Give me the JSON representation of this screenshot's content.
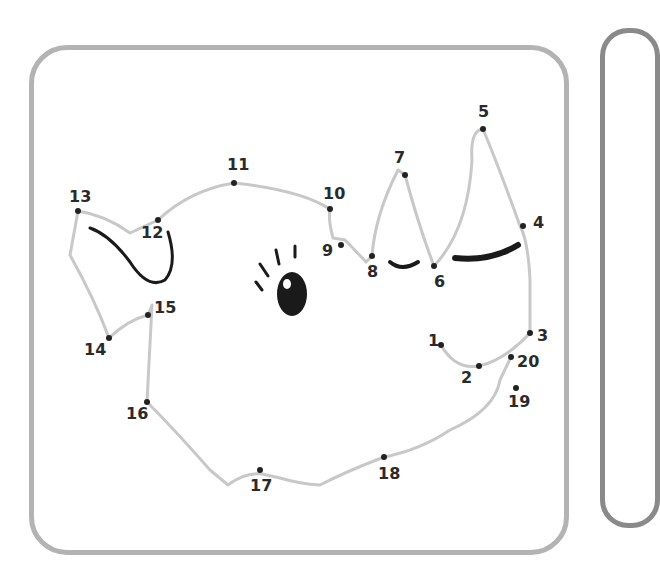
{
  "worksheet": {
    "type": "connect-the-dots",
    "subject": "pig face (drawn by following numbered dots)",
    "colors": {
      "frame": "#b3b3b3",
      "side_frame": "#8a8a8a",
      "traced_line": "#c8c8c8",
      "ink": "#1a1a1a"
    },
    "dots": [
      {
        "n": "1",
        "x": 441,
        "y": 345,
        "lx": 428,
        "ly": 333
      },
      {
        "n": "2",
        "x": 479,
        "y": 366,
        "lx": 461,
        "ly": 370
      },
      {
        "n": "3",
        "x": 530,
        "y": 333,
        "lx": 537,
        "ly": 328
      },
      {
        "n": "4",
        "x": 523,
        "y": 226,
        "lx": 533,
        "ly": 215
      },
      {
        "n": "5",
        "x": 483,
        "y": 129,
        "lx": 478,
        "ly": 104
      },
      {
        "n": "6",
        "x": 434,
        "y": 266,
        "lx": 434,
        "ly": 274
      },
      {
        "n": "7",
        "x": 405,
        "y": 175,
        "lx": 394,
        "ly": 150
      },
      {
        "n": "8",
        "x": 372,
        "y": 256,
        "lx": 367,
        "ly": 264
      },
      {
        "n": "9",
        "x": 341,
        "y": 245,
        "lx": 322,
        "ly": 243
      },
      {
        "n": "10",
        "x": 330,
        "y": 209,
        "lx": 323,
        "ly": 186
      },
      {
        "n": "11",
        "x": 234,
        "y": 183,
        "lx": 227,
        "ly": 157
      },
      {
        "n": "12",
        "x": 158,
        "y": 220,
        "lx": 141,
        "ly": 225
      },
      {
        "n": "13",
        "x": 78,
        "y": 211,
        "lx": 69,
        "ly": 189
      },
      {
        "n": "14",
        "x": 109,
        "y": 338,
        "lx": 84,
        "ly": 342
      },
      {
        "n": "15",
        "x": 148,
        "y": 315,
        "lx": 154,
        "ly": 300
      },
      {
        "n": "16",
        "x": 147,
        "y": 402,
        "lx": 126,
        "ly": 406
      },
      {
        "n": "17",
        "x": 260,
        "y": 470,
        "lx": 250,
        "ly": 478
      },
      {
        "n": "18",
        "x": 384,
        "y": 457,
        "lx": 378,
        "ly": 466
      },
      {
        "n": "19",
        "x": 516,
        "y": 388,
        "lx": 508,
        "ly": 394
      },
      {
        "n": "20",
        "x": 511,
        "y": 357,
        "lx": 517,
        "ly": 354
      }
    ]
  }
}
